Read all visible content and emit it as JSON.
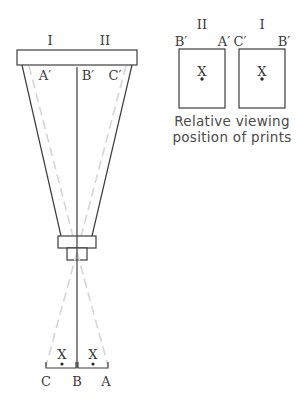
{
  "diagram": {
    "projector": {
      "top_labels": [
        "I",
        "II"
      ],
      "image_labels": [
        "A′",
        "B′",
        "C′"
      ],
      "base_labels": [
        "C",
        "B",
        "A"
      ],
      "subject_marks": [
        "X",
        "X"
      ]
    },
    "prints": {
      "left_print": {
        "set_label": "II",
        "corner_left": "B′",
        "corner_right": "A′",
        "mark": "X"
      },
      "right_print": {
        "set_label": "I",
        "corner_left": "C′",
        "corner_right": "B′",
        "mark": "X"
      },
      "caption_line1": "Relative viewing",
      "caption_line2": "position of prints"
    },
    "colors": {
      "line": "#3c3c3c",
      "dashed": "#d6d6d6",
      "text": "#3a3a3a"
    }
  }
}
